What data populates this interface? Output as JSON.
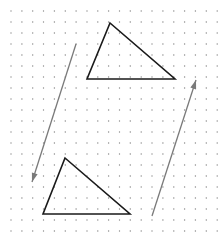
{
  "diagram": {
    "type": "dot-grid-translation",
    "background": "#ffffff",
    "grid": {
      "x0": 11,
      "y0": 11,
      "dx": 10.85,
      "dy": 11.0,
      "cols": 20,
      "rows": 21,
      "dot_color": "#8a8a8a",
      "dot_radius": 0.7
    },
    "shapes": [
      {
        "name": "original-triangle",
        "points": [
          [
            110,
            23
          ],
          [
            87,
            79
          ],
          [
            175,
            79
          ]
        ],
        "stroke": "#1a1a1a",
        "stroke_width": 1.6
      },
      {
        "name": "translated-triangle",
        "points": [
          [
            65,
            158
          ],
          [
            43,
            214
          ],
          [
            130,
            214
          ]
        ],
        "stroke": "#1a1a1a",
        "stroke_width": 1.6
      }
    ],
    "arrows": [
      {
        "name": "translation-arrow-down-left",
        "from": [
          76,
          44
        ],
        "to": [
          32,
          182
        ],
        "stroke": "#7a7a7a",
        "stroke_width": 1.3
      },
      {
        "name": "translation-arrow-up-right",
        "from": [
          152,
          216
        ],
        "to": [
          196,
          80
        ],
        "stroke": "#7a7a7a",
        "stroke_width": 1.3
      }
    ]
  }
}
